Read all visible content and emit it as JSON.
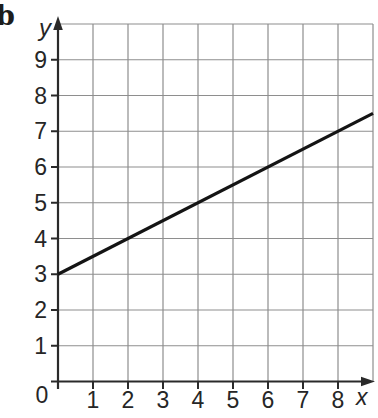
{
  "figure_label": "b",
  "colors": {
    "background": "#ffffff",
    "grid": "#8e8e8e",
    "axis": "#2a2a2a",
    "text": "#262626",
    "line": "#141414"
  },
  "chart_data": {
    "type": "line",
    "title": "",
    "xlabel": "x",
    "ylabel": "y",
    "xlim": [
      0,
      9
    ],
    "ylim": [
      0,
      10
    ],
    "grid": true,
    "legend": false,
    "x_tick_values": [
      0,
      1,
      2,
      3,
      4,
      5,
      6,
      7,
      8
    ],
    "x_tick_labels": [
      "0",
      "1",
      "2",
      "3",
      "4",
      "5",
      "6",
      "7",
      "8"
    ],
    "y_tick_values": [
      1,
      2,
      3,
      4,
      5,
      6,
      7,
      8,
      9
    ],
    "y_tick_labels": [
      "1",
      "2",
      "3",
      "4",
      "5",
      "6",
      "7",
      "8",
      "9"
    ],
    "series": [
      {
        "name": "y = 0.5x + 3",
        "slope": 0.5,
        "y_intercept": 3,
        "x": [
          0,
          9
        ],
        "y": [
          3,
          7.5
        ],
        "sample_points": [
          [
            0,
            3
          ],
          [
            2,
            4
          ],
          [
            4,
            5
          ],
          [
            6,
            6
          ],
          [
            8,
            7
          ]
        ],
        "color": "#141414"
      }
    ]
  }
}
